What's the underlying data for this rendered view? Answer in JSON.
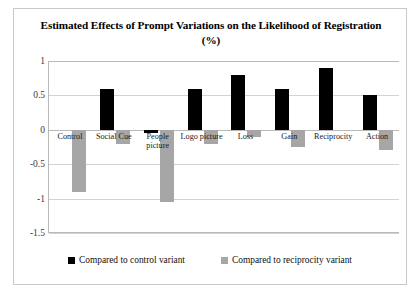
{
  "chart_data": {
    "type": "bar",
    "title": "Estimated Effects of Prompt Variations on the Likelihood of Registration (%)",
    "xlabel": "",
    "ylabel": "",
    "ylim": [
      -1.5,
      1
    ],
    "yticks": [
      "1",
      "0.5",
      "0",
      "-0.5",
      "-1",
      "-1.5"
    ],
    "ytick_values": [
      1,
      0.5,
      0,
      -0.5,
      -1,
      -1.5
    ],
    "grid": true,
    "legend_position": "bottom",
    "categories": [
      "Control",
      "Social Cue",
      "People\npicture",
      "Logo picture",
      "Loss",
      "Gain",
      "Reciprocity",
      "Action"
    ],
    "series": [
      {
        "name": "Compared to control variant",
        "color": "#000000",
        "values": [
          0,
          0.6,
          -0.05,
          0.6,
          0.8,
          0.6,
          0.9,
          0.5
        ]
      },
      {
        "name": "Compared to reciprocity variant",
        "color": "#a6a6a6",
        "values": [
          -0.9,
          -0.2,
          -1.05,
          -0.2,
          -0.1,
          -0.25,
          0,
          -0.3
        ]
      }
    ]
  },
  "legend": {
    "items": [
      {
        "label": "Compared to control variant",
        "color": "#000000"
      },
      {
        "label": "Compared to reciprocity variant",
        "color": "#a6a6a6"
      }
    ]
  }
}
